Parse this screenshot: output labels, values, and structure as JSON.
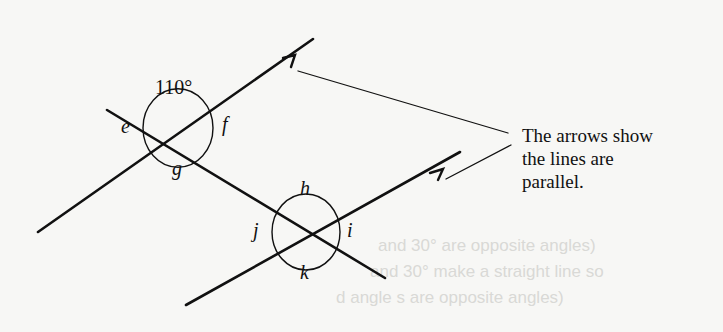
{
  "diagram": {
    "given_angle": "110°",
    "angle_labels": {
      "e": "e",
      "f": "f",
      "g": "g",
      "h": "h",
      "i": "i",
      "j": "j",
      "k": "k"
    },
    "callout": {
      "lines": [
        "The arrows show",
        "the lines are",
        "parallel."
      ]
    },
    "faint_background_text": [
      "and 30° are opposite angles)",
      "and 30° make a straight line so",
      "d angle s are opposite angles)"
    ],
    "colors": {
      "ink": "#111111",
      "paper": "#f7f7f5",
      "faint": "#d9d9d6"
    }
  }
}
